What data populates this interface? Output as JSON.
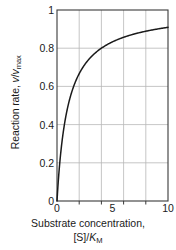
{
  "chart_data": {
    "type": "line",
    "title": "",
    "subtitle": "",
    "xlabel_line1": "Substrate concentration,",
    "xlabel_line2_prefix": "[S]/",
    "xlabel_line2_italic": "K",
    "xlabel_line2_sub": "M",
    "ylabel_prefix": "Reaction rate, ",
    "ylabel_italic1": "v",
    "ylabel_slash": "/",
    "ylabel_italic2": "v",
    "ylabel_sub": "max",
    "xlim": [
      0,
      10
    ],
    "ylim": [
      0,
      1
    ],
    "x_ticks": [
      0,
      2,
      4,
      6,
      8,
      10
    ],
    "x_tick_labels": [
      "0",
      "",
      "5",
      "",
      "10"
    ],
    "x_major_labeled": [
      {
        "value": 0,
        "label": "0"
      },
      {
        "value": 5,
        "label": "5"
      },
      {
        "value": 10,
        "label": "10"
      }
    ],
    "x_gridlines": [
      2,
      4,
      6,
      8
    ],
    "y_ticks": [
      0,
      0.2,
      0.4,
      0.6,
      0.8,
      1
    ],
    "y_tick_labels": [
      "0",
      "0.2",
      "0.4",
      "0.6",
      "0.8",
      "1"
    ],
    "y_gridlines": [
      0.2,
      0.4,
      0.6,
      0.8
    ],
    "grid": true,
    "legend": "none",
    "equation": "y = x / (1 + x)",
    "series": [
      {
        "name": "Michaelis-Menten saturation curve",
        "color": "#1a1a1a",
        "x": [
          0,
          0.1,
          0.2,
          0.3,
          0.4,
          0.5,
          0.6,
          0.8,
          1.0,
          1.2,
          1.5,
          1.8,
          2.0,
          2.5,
          3.0,
          3.5,
          4.0,
          4.5,
          5.0,
          5.5,
          6.0,
          6.5,
          7.0,
          7.5,
          8.0,
          8.5,
          9.0,
          9.5,
          10.0
        ],
        "values": [
          0,
          0.091,
          0.167,
          0.231,
          0.286,
          0.333,
          0.375,
          0.444,
          0.5,
          0.545,
          0.6,
          0.643,
          0.667,
          0.714,
          0.75,
          0.778,
          0.8,
          0.818,
          0.833,
          0.846,
          0.857,
          0.867,
          0.875,
          0.882,
          0.889,
          0.895,
          0.9,
          0.905,
          0.909
        ]
      }
    ]
  },
  "colors": {
    "curve": "#1a1a1a",
    "axis": "#3a3a3a",
    "grid": "#b8b8b8",
    "text": "#1a1a1a",
    "background": "#ffffff"
  }
}
